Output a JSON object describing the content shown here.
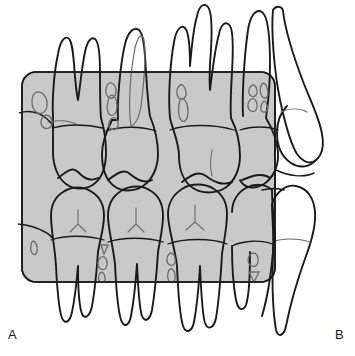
{
  "figure": {
    "panel_labels": {
      "left": "A",
      "right": "B"
    },
    "colors": {
      "background": "#ffffff",
      "film_fill": "#c9c9c9",
      "film_stroke": "#1a1a1a",
      "tooth_stroke": "#1a1a1a",
      "tooth_fill": "#ffffff",
      "detail_stroke": "#6b6b6b",
      "label_color": "#1a1a1a"
    },
    "film": {
      "name": "bitewing-film-overlay",
      "shape": "rounded-rectangle",
      "x": 22,
      "y": 72,
      "width": 253,
      "height": 210,
      "corner_radius": 14,
      "opacity": 0.62
    },
    "arches": [
      {
        "name": "maxillary-arch",
        "position": "upper",
        "teeth": [
          {
            "name": "upper-first-molar",
            "roots": 2,
            "restorations": 2
          },
          {
            "name": "upper-second-molar",
            "roots": 2,
            "restorations": 2
          },
          {
            "name": "upper-third-molar",
            "roots": 3,
            "restorations": 2
          },
          {
            "name": "upper-distal-molar",
            "roots": 1,
            "restorations": 4
          }
        ]
      },
      {
        "name": "mandibular-arch",
        "position": "lower",
        "teeth": [
          {
            "name": "lower-first-molar",
            "roots": 2,
            "restorations": 1
          },
          {
            "name": "lower-second-molar",
            "roots": 2,
            "restorations": 3
          },
          {
            "name": "lower-third-molar",
            "roots": 2,
            "restorations": 2
          },
          {
            "name": "lower-distal-molar",
            "roots": 1,
            "restorations": 2
          }
        ]
      }
    ],
    "adjacent_teeth": [
      {
        "name": "upper-right-premolar",
        "side": "right",
        "roots": 1
      },
      {
        "name": "lower-right-premolar",
        "side": "right",
        "roots": 1
      }
    ]
  }
}
